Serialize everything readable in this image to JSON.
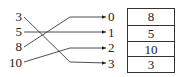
{
  "diagram": {
    "keys": [
      "3",
      "5",
      "8",
      "10"
    ],
    "indices": [
      "0",
      "1",
      "2",
      "3"
    ],
    "table_values": [
      "8",
      "5",
      "10",
      "3"
    ],
    "mappings": [
      {
        "key": "3",
        "index": "3"
      },
      {
        "key": "5",
        "index": "1"
      },
      {
        "key": "8",
        "index": "0"
      },
      {
        "key": "10",
        "index": "2"
      }
    ]
  }
}
